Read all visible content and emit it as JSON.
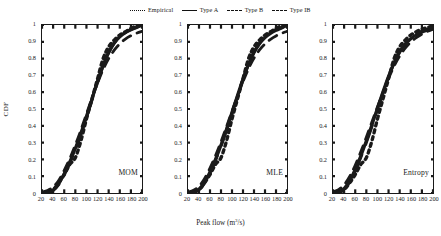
{
  "legend": {
    "position": "top-center",
    "items": [
      {
        "label": "Empirical",
        "style": "dotted",
        "key": "empirical"
      },
      {
        "label": "Type A",
        "style": "solid",
        "key": "typeA"
      },
      {
        "label": "Type B",
        "style": "dashed-fine",
        "key": "typeB"
      },
      {
        "label": "Type IB",
        "style": "dashed",
        "key": "typeIB"
      }
    ]
  },
  "axes": {
    "xlabel": "Peak flow (m",
    "xlabel_sup": "3",
    "xlabel_tail": "/s)",
    "xlabel_full": "Peak flow (m3/s)",
    "ylabel": "CDF",
    "xticks": [
      20,
      40,
      60,
      80,
      100,
      120,
      140,
      160,
      180,
      200
    ],
    "yticks": [
      0,
      0.1,
      0.2,
      0.3,
      0.4,
      0.5,
      0.6,
      0.7,
      0.8,
      0.9,
      1
    ],
    "ytick_labels": [
      "0",
      "0.1",
      "0.2",
      "0.3",
      "0.4",
      "0.5",
      "0.6",
      "0.7",
      "0.8",
      "0.9",
      "1"
    ],
    "xlim": [
      20,
      200
    ],
    "ylim": [
      0,
      1
    ],
    "grid": false
  },
  "panels": [
    {
      "tag": "MOM"
    },
    {
      "tag": "MLE"
    },
    {
      "tag": "Entropy"
    }
  ],
  "colors": {
    "line": "#1a1a1a",
    "background": "#ffffff"
  },
  "chart_data": {
    "type": "line",
    "title": "",
    "xlabel": "Peak flow (m3/s)",
    "ylabel": "CDF",
    "xlim": [
      20,
      200
    ],
    "ylim": [
      0,
      1
    ],
    "grid": false,
    "legend_position": "top-center",
    "panels": [
      {
        "name": "MOM",
        "x": [
          20,
          30,
          40,
          50,
          60,
          70,
          80,
          90,
          100,
          110,
          120,
          130,
          140,
          150,
          160,
          170,
          180,
          190,
          200
        ],
        "series": [
          {
            "name": "Empirical",
            "style": "dotted",
            "values": [
              0.0,
              0.005,
              0.02,
              0.06,
              0.11,
              0.17,
              0.21,
              0.31,
              0.44,
              0.56,
              0.68,
              0.8,
              0.87,
              0.91,
              0.94,
              0.96,
              0.98,
              0.995,
              1.0
            ]
          },
          {
            "name": "Type A",
            "style": "solid",
            "values": [
              0.0,
              0.004,
              0.018,
              0.055,
              0.115,
              0.185,
              0.265,
              0.355,
              0.455,
              0.56,
              0.665,
              0.76,
              0.838,
              0.893,
              0.93,
              0.955,
              0.972,
              0.985,
              1.0
            ]
          },
          {
            "name": "Type B",
            "style": "dashed-fine",
            "values": [
              0.005,
              0.015,
              0.035,
              0.075,
              0.135,
              0.205,
              0.285,
              0.375,
              0.47,
              0.565,
              0.655,
              0.735,
              0.8,
              0.85,
              0.888,
              0.916,
              0.936,
              0.951,
              0.962
            ]
          },
          {
            "name": "Type IB",
            "style": "dashed",
            "values": [
              0.0,
              0.003,
              0.015,
              0.05,
              0.108,
              0.178,
              0.258,
              0.348,
              0.448,
              0.553,
              0.658,
              0.755,
              0.835,
              0.892,
              0.93,
              0.956,
              0.973,
              0.986,
              1.0
            ]
          }
        ]
      },
      {
        "name": "MLE",
        "x": [
          20,
          30,
          40,
          50,
          60,
          70,
          80,
          90,
          100,
          110,
          120,
          130,
          140,
          150,
          160,
          170,
          180,
          190,
          200
        ],
        "series": [
          {
            "name": "Empirical",
            "style": "dotted",
            "values": [
              0.0,
              0.005,
              0.02,
              0.06,
              0.11,
              0.17,
              0.21,
              0.31,
              0.44,
              0.56,
              0.68,
              0.8,
              0.87,
              0.91,
              0.94,
              0.96,
              0.98,
              0.995,
              1.0
            ]
          },
          {
            "name": "Type A",
            "style": "solid",
            "values": [
              0.0,
              0.005,
              0.022,
              0.062,
              0.125,
              0.2,
              0.285,
              0.38,
              0.48,
              0.58,
              0.678,
              0.765,
              0.836,
              0.888,
              0.925,
              0.95,
              0.968,
              0.982,
              1.0
            ]
          },
          {
            "name": "Type B",
            "style": "dashed-fine",
            "values": [
              0.005,
              0.016,
              0.04,
              0.085,
              0.148,
              0.222,
              0.305,
              0.395,
              0.487,
              0.578,
              0.663,
              0.74,
              0.803,
              0.852,
              0.888,
              0.915,
              0.935,
              0.95,
              0.962
            ]
          },
          {
            "name": "Type IB",
            "style": "dashed",
            "values": [
              0.0,
              0.004,
              0.019,
              0.058,
              0.12,
              0.194,
              0.279,
              0.374,
              0.475,
              0.577,
              0.676,
              0.765,
              0.838,
              0.892,
              0.93,
              0.955,
              0.972,
              0.984,
              1.0
            ]
          }
        ]
      },
      {
        "name": "Entropy",
        "x": [
          20,
          30,
          40,
          50,
          60,
          70,
          80,
          90,
          100,
          110,
          120,
          130,
          140,
          150,
          160,
          170,
          180,
          190,
          200
        ],
        "series": [
          {
            "name": "Empirical",
            "style": "dotted",
            "values": [
              0.0,
              0.005,
              0.02,
              0.06,
              0.11,
              0.17,
              0.21,
              0.31,
              0.44,
              0.56,
              0.68,
              0.8,
              0.87,
              0.91,
              0.94,
              0.96,
              0.975,
              0.985,
              0.995
            ]
          },
          {
            "name": "Type A",
            "style": "solid",
            "values": [
              0.0,
              0.006,
              0.026,
              0.072,
              0.14,
              0.22,
              0.31,
              0.405,
              0.505,
              0.603,
              0.695,
              0.775,
              0.84,
              0.885,
              0.918,
              0.942,
              0.958,
              0.97,
              0.98
            ]
          },
          {
            "name": "Type B",
            "style": "dashed-fine",
            "values": [
              0.006,
              0.02,
              0.048,
              0.098,
              0.165,
              0.245,
              0.332,
              0.422,
              0.512,
              0.6,
              0.682,
              0.755,
              0.815,
              0.862,
              0.898,
              0.925,
              0.945,
              0.962,
              0.975
            ]
          },
          {
            "name": "Type IB",
            "style": "dashed",
            "values": [
              0.0,
              0.005,
              0.023,
              0.066,
              0.132,
              0.212,
              0.3,
              0.396,
              0.498,
              0.598,
              0.69,
              0.772,
              0.84,
              0.888,
              0.922,
              0.946,
              0.963,
              0.976,
              0.988
            ]
          }
        ]
      }
    ]
  }
}
